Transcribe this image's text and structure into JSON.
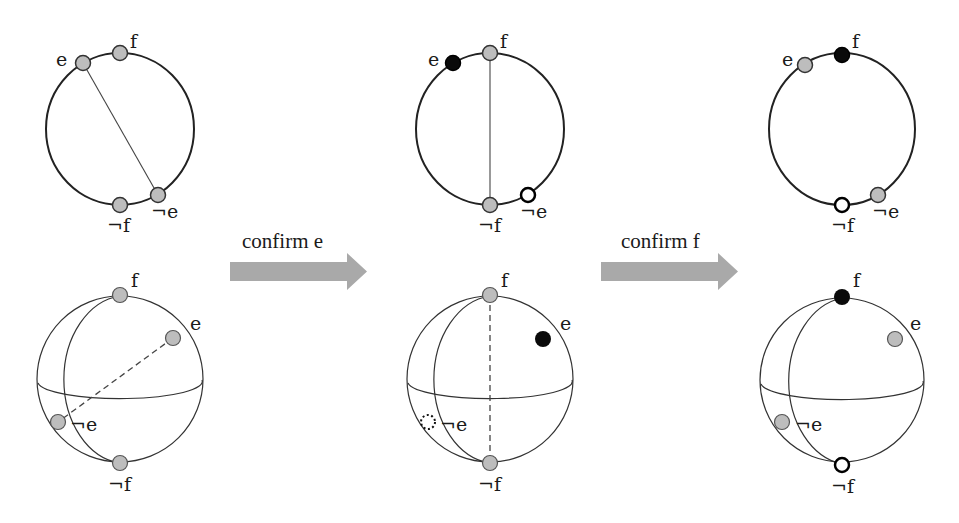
{
  "diagram": {
    "colors": {
      "point_grey": "#bdbdbd",
      "point_black": "#0a0a0a",
      "point_open": "#ffffff",
      "arrow": "#a9a9a9",
      "stroke": "#222222"
    },
    "arrows": [
      {
        "label": "confirm e"
      },
      {
        "label": "confirm f"
      }
    ],
    "stages": [
      {
        "name": "initial",
        "circle": {
          "labels": {
            "e": "e",
            "f": "f",
            "not_f": "¬f",
            "not_e": "¬e"
          },
          "points": {
            "e": "grey",
            "f": "grey",
            "not_f": "grey",
            "not_e": "grey"
          },
          "chord": "e to ¬e"
        },
        "sphere": {
          "labels": {
            "e": "e",
            "f": "f",
            "not_f": "¬f",
            "not_e": "¬e"
          },
          "points": {
            "e": "grey",
            "f": "grey",
            "not_f": "grey",
            "not_e": "grey"
          },
          "axis": "e to ¬e (dashed)"
        }
      },
      {
        "name": "after confirm e",
        "circle": {
          "labels": {
            "e": "e",
            "f": "f",
            "not_f": "¬f",
            "not_e": "¬e"
          },
          "points": {
            "e": "black",
            "f": "grey",
            "not_f": "grey",
            "not_e": "open"
          },
          "chord": "f to ¬f"
        },
        "sphere": {
          "labels": {
            "e": "e",
            "f": "f",
            "not_f": "¬f",
            "not_e": "¬e"
          },
          "points": {
            "e": "black",
            "f": "grey",
            "not_f": "grey",
            "not_e": "dotted"
          },
          "axis": "f to ¬f (dashed)"
        }
      },
      {
        "name": "after confirm f",
        "circle": {
          "labels": {
            "e": "e",
            "f": "f",
            "not_f": "¬f",
            "not_e": "¬e"
          },
          "points": {
            "e": "grey",
            "f": "black",
            "not_f": "open",
            "not_e": "grey"
          },
          "chord": "none"
        },
        "sphere": {
          "labels": {
            "e": "e",
            "f": "f",
            "not_f": "¬f",
            "not_e": "¬e"
          },
          "points": {
            "e": "grey",
            "f": "black",
            "not_f": "open",
            "not_e": "grey"
          },
          "axis": "none"
        }
      }
    ]
  }
}
